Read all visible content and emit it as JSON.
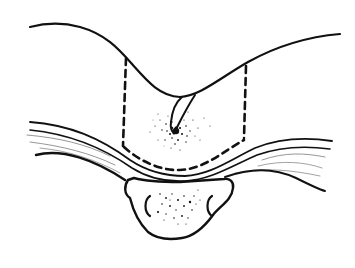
{
  "figure": {
    "type": "line-drawing",
    "subject": "cross-section illustration: skin surface with midline cleft, sinus tract with surrounding stippling, dashed excision outline, subcutaneous tissue layers, and bone cross-section",
    "colors": {
      "ink": "#111111",
      "background": "#ffffff",
      "faint_ink": "#8a8a8a"
    },
    "elements": [
      {
        "id": "skin-surface",
        "label": "skin surface curve"
      },
      {
        "id": "sinus-tract",
        "label": "sinus tract"
      },
      {
        "id": "stippling-lesion",
        "label": "stippled area around sinus"
      },
      {
        "id": "excision-outline",
        "label": "dashed excision margin"
      },
      {
        "id": "tissue-layers",
        "label": "fascial / subcutaneous layers"
      },
      {
        "id": "bone",
        "label": "bone cross-section"
      }
    ]
  }
}
